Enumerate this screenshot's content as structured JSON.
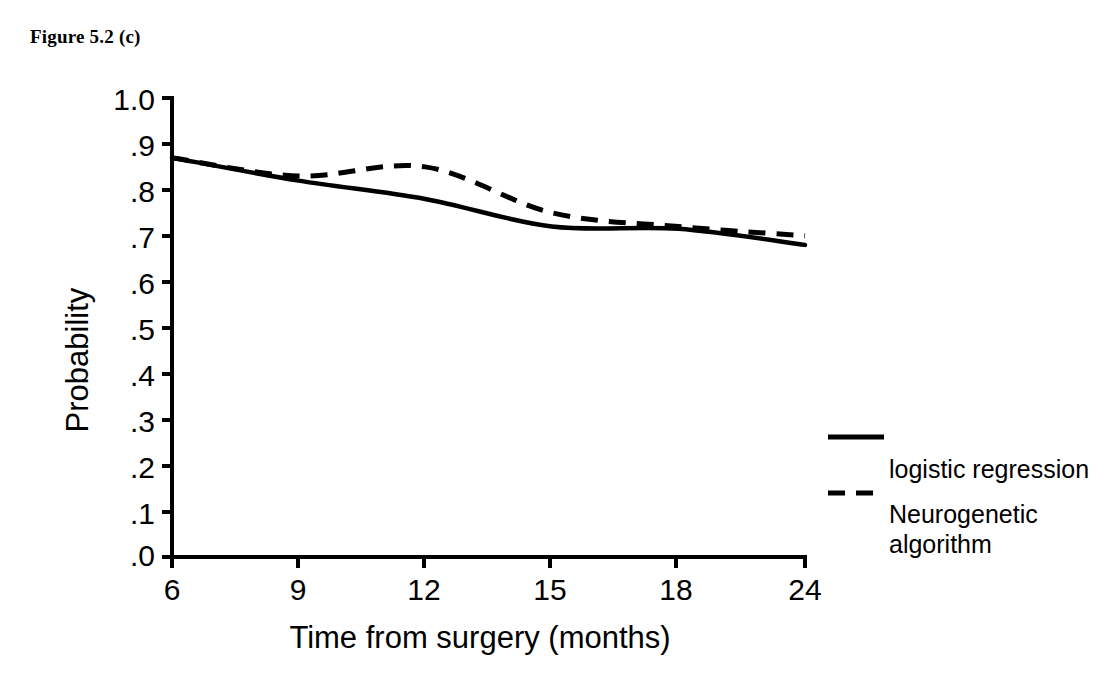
{
  "figure": {
    "title": "Figure 5.2 (c)"
  },
  "chart_data": {
    "type": "line",
    "title": "",
    "xlabel": "Time from surgery (months)",
    "ylabel": "Probability",
    "categories": [
      "6",
      "9",
      "12",
      "15",
      "18",
      "24"
    ],
    "x_tick_labels": [
      "6",
      "9",
      "12",
      "15",
      "18",
      "24"
    ],
    "y_tick_labels": [
      "1.0",
      ".9",
      ".8",
      ".7",
      ".6",
      ".5",
      ".4",
      ".3",
      ".2",
      ".1",
      ".0"
    ],
    "y_tick_values": [
      1.0,
      0.9,
      0.8,
      0.7,
      0.6,
      0.5,
      0.4,
      0.3,
      0.2,
      0.1,
      0.0
    ],
    "ylim": [
      0.0,
      1.0
    ],
    "grid": false,
    "legend_position": "right",
    "series": [
      {
        "name": "logistic regression",
        "style": "solid",
        "color": "#000000",
        "values": [
          0.87,
          0.82,
          0.78,
          0.72,
          0.715,
          0.68
        ]
      },
      {
        "name": "Neurogenetic algorithm",
        "style": "dashed",
        "color": "#000000",
        "values": [
          0.87,
          0.83,
          0.85,
          0.75,
          0.72,
          0.7
        ]
      }
    ]
  },
  "legend": {
    "entries": [
      {
        "label": "logistic regression",
        "style": "solid"
      },
      {
        "label": "Neurogenetic",
        "label_line2": "algorithm",
        "style": "dashed"
      }
    ]
  }
}
